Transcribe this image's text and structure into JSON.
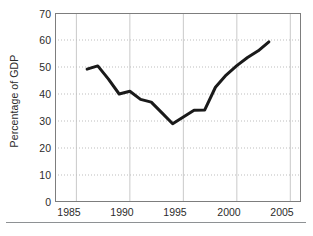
{
  "chart_data": {
    "type": "line",
    "title": "",
    "subtitle": "",
    "xlabel": "",
    "ylabel": "Percentage of GDP",
    "xlim": [
      1983,
      2006
    ],
    "ylim": [
      0,
      70
    ],
    "ytick_step": 10,
    "xtick_step": 5,
    "yticks": [
      0,
      10,
      20,
      30,
      40,
      50,
      60,
      70
    ],
    "xticks": [
      1985,
      1990,
      1995,
      2000,
      2005
    ],
    "grid": "major vertical solid, horizontal dotted at y ticks",
    "legend": "none",
    "line_color": "#1a1a1a",
    "line_width_px": 3,
    "series": [
      {
        "name": "Percentage of GDP",
        "x": [
          1986,
          1987,
          1988,
          1989,
          1990,
          1991,
          1992,
          1993,
          1994,
          1995,
          1996,
          1997,
          1998,
          1999,
          2000,
          2001,
          2002,
          2003
        ],
        "values": [
          49.2,
          50.4,
          45.5,
          40.0,
          41.0,
          38.0,
          37.0,
          33.0,
          29.0,
          31.5,
          34.0,
          34.1,
          42.5,
          47.0,
          50.5,
          53.5,
          56.0,
          59.3
        ]
      }
    ]
  },
  "axes": {
    "y_axis_label": "Percentage of GDP",
    "y_tick_labels": [
      "70",
      "60",
      "50",
      "40",
      "30",
      "20",
      "10",
      "0"
    ],
    "x_tick_labels": [
      "1985",
      "1990",
      "1995",
      "2000",
      "2005"
    ]
  },
  "footer": {
    "caption": ""
  },
  "colors": {
    "line": "#1a1a1a",
    "frame": "#7d7d7d",
    "gridline_solid": "#c9c9c9",
    "gridline_dotted": "#bdbdbd",
    "text": "#2b2b2b",
    "rule": "#8e9194",
    "background": "#ffffff"
  }
}
